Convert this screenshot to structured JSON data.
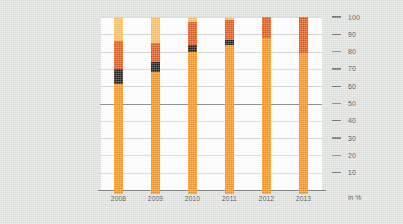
{
  "chart_data": {
    "type": "bar",
    "title": "",
    "subtitle": "",
    "xlabel": "",
    "ylabel": "in %",
    "unit_label": "in %",
    "stacked": true,
    "grid": true,
    "legend_position": "none",
    "ylim": [
      0,
      100
    ],
    "yticks": [
      100,
      90,
      80,
      70,
      60,
      50,
      40,
      30,
      20,
      10
    ],
    "ytick_labels": [
      "100",
      "90",
      "80",
      "70",
      "60",
      "50",
      "40",
      "30",
      "20",
      "10"
    ],
    "major_gridline_value": 50,
    "categories": [
      "2008",
      "2009",
      "2010",
      "2011",
      "2012",
      "2013"
    ],
    "series": [
      {
        "name": "segment-1-orange",
        "color": "#F6931E",
        "values": [
          61,
          68,
          80,
          84,
          88,
          79
        ]
      },
      {
        "name": "segment-2-black",
        "color": "#231F20",
        "values": [
          9,
          6,
          4,
          3,
          0,
          0
        ]
      },
      {
        "name": "segment-3-dark-orange",
        "color": "#DE5816",
        "values": [
          16,
          11,
          13,
          11,
          12,
          21
        ]
      },
      {
        "name": "segment-4-light-orange",
        "color": "#FBBE5E",
        "values": [
          14,
          15,
          3,
          2,
          0,
          0
        ]
      }
    ],
    "colors": {
      "orange": "#F6931E",
      "black": "#231F20",
      "dark_orange": "#DE5816",
      "light_orange": "#FBBE5E",
      "background": "#DFE3DE",
      "plot_background": "#FFFFFF",
      "gridline": "#D3D3D3",
      "major_gridline": "#8B8B8B",
      "axis": "#7A7A7A",
      "text": "#3F3F3F"
    }
  }
}
